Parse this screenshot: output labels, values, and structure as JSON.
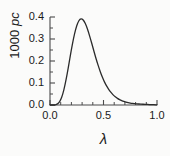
{
  "chart_data": {
    "type": "line",
    "title": "",
    "subtitle": "",
    "xlabel": "λ",
    "ylabel_prefix": "1000 ",
    "ylabel_italic": "pc",
    "ylabel": "1000 pc",
    "xlim": [
      0.0,
      1.0
    ],
    "ylim": [
      0.0,
      0.4
    ],
    "xticks": [
      0.0,
      0.5,
      1.0
    ],
    "xtick_labels": [
      "0.0",
      "0.5",
      "1.0"
    ],
    "yticks": [
      0.0,
      0.1,
      0.2,
      0.3,
      0.4
    ],
    "ytick_labels": [
      "0.0",
      "0.1",
      "0.2",
      "0.3",
      "0.4"
    ],
    "x_minor_tick_step": 0.1,
    "y_minor_tick_step": 0.05,
    "grid": false,
    "legend": null,
    "legend_position": "none",
    "line_color": "#2b2b2b",
    "line_width": 1.3,
    "background_color": "#fbfbfa",
    "axis_color": "#4a4a4a",
    "text_color": "#1a1a1a",
    "annotations": [],
    "series": [
      {
        "name": "1000 pc",
        "x": [
          0.0,
          0.02,
          0.04,
          0.06,
          0.08,
          0.1,
          0.12,
          0.14,
          0.16,
          0.18,
          0.2,
          0.22,
          0.24,
          0.26,
          0.28,
          0.3,
          0.32,
          0.34,
          0.36,
          0.38,
          0.4,
          0.42,
          0.44,
          0.46,
          0.48,
          0.5,
          0.52,
          0.54,
          0.56,
          0.58,
          0.6,
          0.62,
          0.64,
          0.66,
          0.68,
          0.7,
          0.72,
          0.74,
          0.76,
          0.78,
          0.8,
          0.82,
          0.84,
          0.86,
          0.88,
          0.9,
          0.92,
          0.94,
          0.96,
          0.98,
          1.0
        ],
        "y": [
          0.0,
          0.0,
          0.0,
          0.002,
          0.008,
          0.023,
          0.05,
          0.09,
          0.14,
          0.196,
          0.252,
          0.303,
          0.345,
          0.375,
          0.391,
          0.392,
          0.381,
          0.36,
          0.331,
          0.298,
          0.263,
          0.228,
          0.195,
          0.165,
          0.138,
          0.114,
          0.094,
          0.077,
          0.063,
          0.051,
          0.041,
          0.033,
          0.027,
          0.022,
          0.018,
          0.015,
          0.012,
          0.01,
          0.008,
          0.007,
          0.006,
          0.005,
          0.004,
          0.004,
          0.003,
          0.003,
          0.002,
          0.002,
          0.002,
          0.001,
          0.001
        ]
      }
    ],
    "peak": {
      "x": 0.29,
      "y": 0.392
    }
  }
}
